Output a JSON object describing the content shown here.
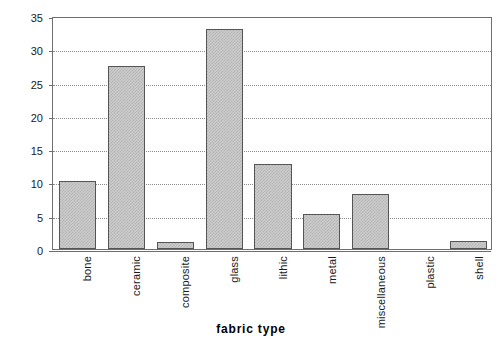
{
  "chart_data": {
    "type": "bar",
    "title": "",
    "xlabel": "fabric type",
    "ylabel": "percentage",
    "categories": [
      "bone",
      "ceramic",
      "composite",
      "glass",
      "lithic",
      "metal",
      "miscellaneous",
      "plastic",
      "shell"
    ],
    "values": [
      10.2,
      27.5,
      1.0,
      33.0,
      12.8,
      5.2,
      8.2,
      0,
      1.2
    ],
    "ylim": [
      0,
      35
    ],
    "ytick_values": [
      0,
      5,
      10,
      15,
      20,
      25,
      30,
      35
    ],
    "ytick_labels": [
      "0",
      "5",
      "10",
      "15",
      "20",
      "25",
      "30",
      "35"
    ],
    "grid": "horizontal-dotted",
    "legend": "none",
    "bar_fill_color": "#cccccc",
    "bar_border_color": "#555555",
    "gridline_color": "#8a8a8a",
    "axis_color": "#6e6e6e",
    "background_color": "#ffffff",
    "text_color": "#1a1a1a"
  }
}
